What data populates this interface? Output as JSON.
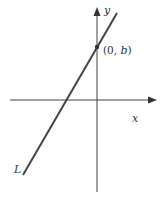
{
  "diagram": {
    "type": "coordinate-plane-line",
    "axes": {
      "x_label": "x",
      "y_label": "y"
    },
    "line": {
      "label": "L",
      "description": "line with positive slope crossing the y-axis above the origin"
    },
    "point": {
      "label_open": "(0, ",
      "label_var": "b",
      "label_close": ")"
    },
    "colors": {
      "stroke": "#444444",
      "background": "#ffffff"
    }
  }
}
